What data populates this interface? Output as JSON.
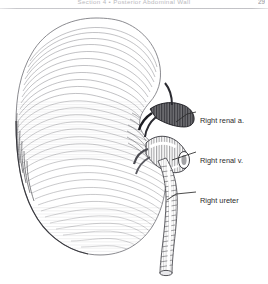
{
  "page": {
    "width": 268,
    "height": 284,
    "background": "#ffffff",
    "ink": "#2b2b2b"
  },
  "header": {
    "running_title": "Section 4 • Posterior Abdominal Wall",
    "page_number": "29",
    "rule_color": "#c2c2c6",
    "text_color": "#b9b9bd"
  },
  "figure": {
    "style": "pen-and-ink hatched line drawing",
    "organ_label": "right kidney",
    "structures": [
      {
        "name": "kidney-body",
        "shading": "fine parallel hatching",
        "tone": "#7a7a7e"
      },
      {
        "name": "renal-artery",
        "tone": "#1e1e1e"
      },
      {
        "name": "renal-vein",
        "tone": "#6e6e72"
      },
      {
        "name": "ureter",
        "tone": "#5a5a5e"
      }
    ]
  },
  "labels": [
    {
      "id": "right-renal-artery",
      "text": "Right renal a.",
      "leader": {
        "from_x": 176,
        "from_y": 113,
        "to_x": 197,
        "to_y": 111
      }
    },
    {
      "id": "right-renal-vein",
      "text": "Right renal v.",
      "leader": {
        "from_x": 172,
        "from_y": 151,
        "to_x": 197,
        "to_y": 151
      }
    },
    {
      "id": "right-ureter",
      "text": "Right ureter",
      "leader": {
        "from_x": 167,
        "from_y": 191,
        "to_x": 197,
        "to_y": 191
      }
    }
  ]
}
